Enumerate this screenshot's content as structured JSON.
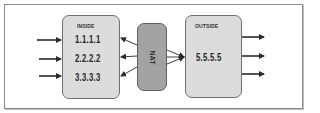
{
  "diagram": {
    "inside": {
      "title": "INSIDE",
      "addresses": [
        "1.1.1.1",
        "2.2.2.2",
        "3.3.3.3"
      ]
    },
    "nat": {
      "label": "NAT"
    },
    "outside": {
      "title": "OUTSIDE",
      "addresses": [
        "5.5.5.5"
      ]
    },
    "colors": {
      "box_fill": "#dcdcdc",
      "nat_fill": "#a3a3a3",
      "border": "#6f6f6f",
      "arrow": "#2a2a2a"
    },
    "connections": [
      {
        "from": "external-left",
        "to": "inside",
        "count": 3
      },
      {
        "from": "nat",
        "to": "inside",
        "count": 3,
        "direction": "nat-to-inside"
      },
      {
        "from": "nat",
        "to": "outside",
        "count": 3,
        "direction": "converging"
      },
      {
        "from": "outside",
        "to": "external-right",
        "count": 3
      }
    ]
  }
}
